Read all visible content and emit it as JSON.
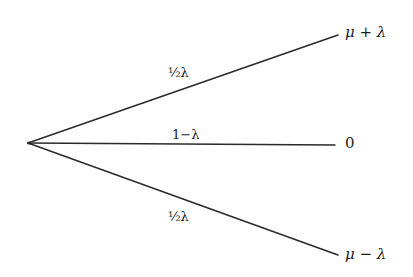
{
  "diagram": {
    "type": "probability-tree",
    "root": {
      "x": 28,
      "y": 143
    },
    "branches": [
      {
        "name": "upper",
        "probability_label": "½λ",
        "outcome_label": "μ + λ",
        "end": {
          "x": 338,
          "y": 35
        }
      },
      {
        "name": "middle",
        "probability_label": "1−λ",
        "outcome_label": "0",
        "end": {
          "x": 335,
          "y": 145
        }
      },
      {
        "name": "lower",
        "probability_label": "½λ",
        "outcome_label": "μ − λ",
        "end": {
          "x": 338,
          "y": 255
        }
      }
    ],
    "colors": {
      "line": "#2a2a2a",
      "text": "#1e1e1e",
      "background": "#ffffff"
    }
  }
}
